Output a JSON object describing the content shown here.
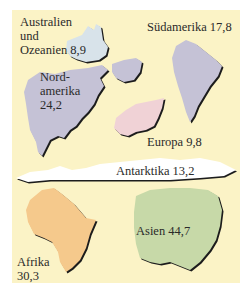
{
  "colors": {
    "background": "#fbf3c6",
    "australia": "#d8e3ea",
    "north_america": "#c5c2d6",
    "south_america": "#c5c2d6",
    "europe": "#f0d2d6",
    "antarctica": "#ffffff",
    "africa": "#f5c98c",
    "asia": "#c7d9a8"
  },
  "continents": [
    {
      "name": "Australien und Ozeanien",
      "lines": [
        "Australien",
        "und",
        "Ozeanien  8,9"
      ],
      "value": "8,9"
    },
    {
      "name": "Südamerika",
      "lines": [
        "Südamerika  17,8"
      ],
      "value": "17,8"
    },
    {
      "name": "Nordamerika",
      "lines": [
        "Nord-",
        "amerika",
        "24,2"
      ],
      "value": "24,2"
    },
    {
      "name": "Europa",
      "lines": [
        "Europa  9,8"
      ],
      "value": "9,8"
    },
    {
      "name": "Antarktika",
      "lines": [
        "Antarktika  13,2"
      ],
      "value": "13,2"
    },
    {
      "name": "Afrika",
      "lines": [
        "Afrika",
        "30,3"
      ],
      "value": "30,3"
    },
    {
      "name": "Asien",
      "lines": [
        "Asien  44,7"
      ],
      "value": "44,7"
    }
  ]
}
